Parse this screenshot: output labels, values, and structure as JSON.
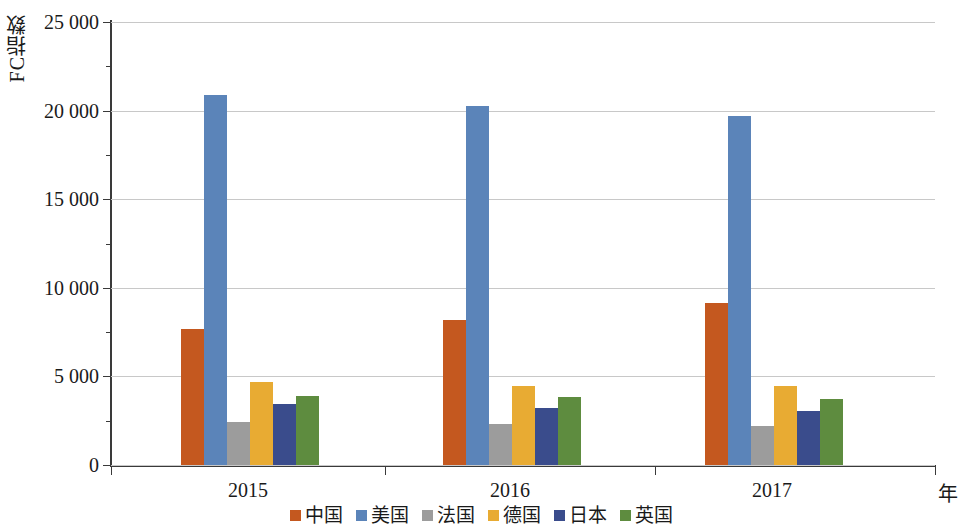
{
  "chart_data": {
    "type": "bar",
    "title": "",
    "subtitle": "",
    "xlabel": "年",
    "ylabel": "FC指数",
    "categories": [
      "2015",
      "2016",
      "2017"
    ],
    "ylim": [
      0,
      25000
    ],
    "ytick_values": [
      25000,
      20000,
      15000,
      10000,
      5000,
      0
    ],
    "ytick_labels": [
      "25 000",
      "20 000",
      "15 000",
      "10 000",
      "5 000",
      "0"
    ],
    "grid": true,
    "legend_position": "bottom",
    "series": [
      {
        "name": "中国",
        "color": "#C4581F",
        "values": [
          7700,
          8190,
          9150
        ]
      },
      {
        "name": "美国",
        "color": "#5B84B9",
        "values": [
          20900,
          20280,
          19720
        ]
      },
      {
        "name": "法国",
        "color": "#9C9C9C",
        "values": [
          2450,
          2320,
          2200
        ]
      },
      {
        "name": "德国",
        "color": "#E8AB33",
        "values": [
          4700,
          4460,
          4460
        ]
      },
      {
        "name": "日本",
        "color": "#3A4C8C",
        "values": [
          3450,
          3220,
          3050
        ]
      },
      {
        "name": "英国",
        "color": "#5E8C3F",
        "values": [
          3900,
          3840,
          3730
        ]
      }
    ]
  },
  "axes": {
    "y_title": "FC指数",
    "x_unit": "年"
  },
  "legend": {
    "items": [
      {
        "label": "中国",
        "color": "#C4581F"
      },
      {
        "label": "美国",
        "color": "#5B84B9"
      },
      {
        "label": "法国",
        "color": "#9C9C9C"
      },
      {
        "label": "德国",
        "color": "#E8AB33"
      },
      {
        "label": "日本",
        "color": "#3A4C8C"
      },
      {
        "label": "英国",
        "color": "#5E8C3F"
      }
    ]
  }
}
